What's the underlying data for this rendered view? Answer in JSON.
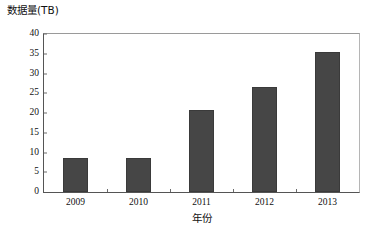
{
  "chart_data": {
    "type": "bar",
    "title": "",
    "xlabel": "年份",
    "ylabel": "数据量(TB)",
    "categories": [
      "2009",
      "2010",
      "2011",
      "2012",
      "2013"
    ],
    "values": [
      8.6,
      8.5,
      20.7,
      26.5,
      35.4
    ],
    "ylim": [
      0,
      40
    ],
    "yticks": [
      "0",
      "5",
      "10",
      "15",
      "20",
      "25",
      "30",
      "35",
      "40"
    ],
    "ytick_values": [
      0,
      5,
      10,
      15,
      20,
      25,
      30,
      35,
      40
    ],
    "grid": false,
    "legend": null,
    "series_color": "#464646",
    "axis_color": "#555555",
    "background": "#ffffff"
  }
}
